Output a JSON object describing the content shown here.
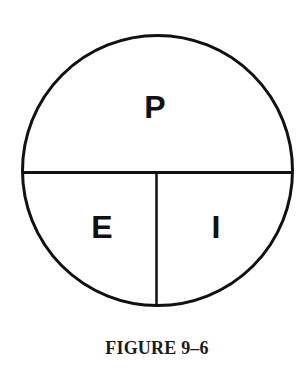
{
  "diagram": {
    "shape": "circle",
    "regions": [
      {
        "id": "top",
        "label": "P"
      },
      {
        "id": "bottom-left",
        "label": "E"
      },
      {
        "id": "bottom-right",
        "label": "I"
      }
    ],
    "caption": "FIGURE 9–6",
    "colors": {
      "stroke": "#111111",
      "background": "#ffffff"
    }
  }
}
